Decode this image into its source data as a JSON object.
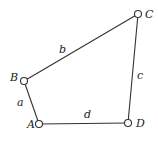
{
  "diagram": {
    "type": "four-bar-linkage",
    "colors": {
      "line": "#333333",
      "text": "#222222",
      "background": "#ffffff"
    },
    "joints": [
      {
        "id": "A",
        "label": "A",
        "x": 39,
        "y": 124,
        "label_x": 27,
        "label_y": 128
      },
      {
        "id": "B",
        "label": "B",
        "x": 24,
        "y": 81,
        "label_x": 10,
        "label_y": 81
      },
      {
        "id": "C",
        "label": "C",
        "x": 138,
        "y": 14,
        "label_x": 145,
        "label_y": 18
      },
      {
        "id": "D",
        "label": "D",
        "x": 128,
        "y": 123,
        "label_x": 136,
        "label_y": 127
      }
    ],
    "links": [
      {
        "id": "a",
        "label": "a",
        "from": "A",
        "to": "B",
        "label_x": 17,
        "label_y": 106
      },
      {
        "id": "b",
        "label": "b",
        "from": "B",
        "to": "C",
        "label_x": 59,
        "label_y": 53
      },
      {
        "id": "c",
        "label": "c",
        "from": "C",
        "to": "D",
        "label_x": 137,
        "label_y": 79
      },
      {
        "id": "d",
        "label": "d",
        "from": "A",
        "to": "D",
        "label_x": 84,
        "label_y": 118
      }
    ]
  }
}
